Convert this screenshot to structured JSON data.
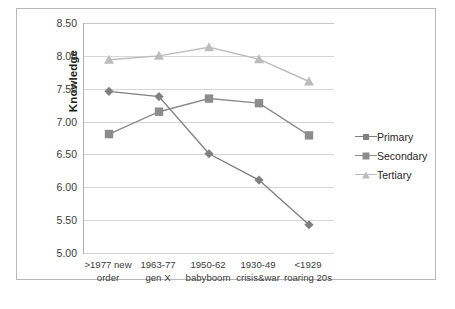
{
  "chart_data": {
    "type": "line",
    "title": "",
    "xlabel": "",
    "ylabel": "Knowledge",
    "ylim": [
      5.0,
      8.5
    ],
    "ytick_step": 0.5,
    "ytick_labels": [
      "8.50",
      "8.00",
      "7.50",
      "7.00",
      "6.50",
      "6.00",
      "5.50",
      "5.00"
    ],
    "ytick_values": [
      8.5,
      8.0,
      7.5,
      7.0,
      6.5,
      6.0,
      5.5,
      5.0
    ],
    "grid": true,
    "legend_position": "right",
    "categories": [
      {
        "line1": ">1977 new",
        "line2": "order"
      },
      {
        "line1": "1963-77",
        "line2": "gen X"
      },
      {
        "line1": "1950-62",
        "line2": "babyboom"
      },
      {
        "line1": "1930-49",
        "line2": "crisis&war"
      },
      {
        "line1": "<1929",
        "line2": "roaring 20s"
      }
    ],
    "series": [
      {
        "name": "Primary",
        "marker": "diamond",
        "color": "#808080",
        "values": [
          7.46,
          7.38,
          6.51,
          6.11,
          5.43
        ]
      },
      {
        "name": "Secondary",
        "marker": "square",
        "color": "#8c8c8c",
        "values": [
          6.81,
          7.15,
          7.35,
          7.28,
          6.79
        ]
      },
      {
        "name": "Tertiary",
        "marker": "triangle",
        "color": "#bcbcbc",
        "values": [
          7.94,
          8.0,
          8.13,
          7.95,
          7.61
        ]
      }
    ]
  },
  "legend": {
    "items": [
      {
        "label": "Primary"
      },
      {
        "label": "Secondary"
      },
      {
        "label": "Tertiary"
      }
    ]
  },
  "colors": {
    "primary": "#808080",
    "secondary": "#8c8c8c",
    "tertiary": "#bcbcbc",
    "grid": "#d6d6d6",
    "axis": "#9a9a9a",
    "frame_border": "#b8b8b8",
    "text": "#3b3b3b"
  }
}
